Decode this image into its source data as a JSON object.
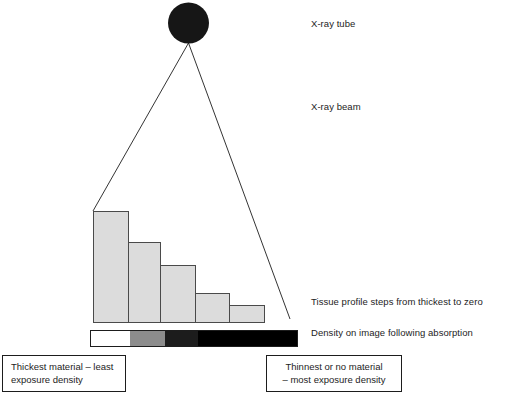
{
  "figure": {
    "background": "#ffffff"
  },
  "source": {
    "label": "x-ray-tube",
    "shape": "filled-circle",
    "color": "#161616",
    "cx": 188.5,
    "cy": 23,
    "r": 20.5
  },
  "beam": {
    "label": "x-ray-beam",
    "apex": {
      "x": 188.5,
      "y": 43
    },
    "left_end": {
      "x": 93,
      "y": 211
    },
    "right_end": {
      "x": 290,
      "y": 319
    },
    "stroke": "#1d1d1d",
    "stroke_width": 0.9
  },
  "labels": {
    "xray_tube": "X-ray tube",
    "xray_beam": "X-ray beam",
    "tissue_profile": "Tissue profile steps from thickest to zero",
    "density_on_image": "Density on image following absorption"
  },
  "captions": {
    "thickest": {
      "line1": "Thickest material – least",
      "line2": "exposure density"
    },
    "thinnest": {
      "line1": "Thinnest or no material",
      "line2": "– most exposure density"
    }
  },
  "chart_data": {
    "type": "bar",
    "title": "Tissue profile steps from thickest to zero",
    "xlabel": "",
    "ylabel": "Tissue thickness",
    "grid": false,
    "legend": false,
    "baseline_y": 322,
    "bar_fill": "#dcdcdc",
    "bar_stroke": "#4a4a4a",
    "categories": [
      "step-1",
      "step-2",
      "step-3",
      "step-4",
      "step-5"
    ],
    "values": [
      111,
      80,
      57,
      29,
      17
    ],
    "ylim": [
      0,
      120
    ],
    "bars": [
      {
        "name": "step-1",
        "x": 93,
        "width": 35,
        "top": 211,
        "height": 111
      },
      {
        "name": "step-2",
        "x": 128,
        "width": 32,
        "top": 242,
        "height": 80
      },
      {
        "name": "step-3",
        "x": 160,
        "width": 35,
        "top": 265,
        "height": 57
      },
      {
        "name": "step-4",
        "x": 195,
        "width": 34,
        "top": 293,
        "height": 29
      },
      {
        "name": "step-5",
        "x": 229,
        "width": 35,
        "top": 305,
        "height": 17
      }
    ]
  },
  "density_bar": {
    "name": "density-strip",
    "x": 90,
    "y": 330,
    "width": 208,
    "height": 17,
    "stroke": "#1d1d1d",
    "segments": [
      {
        "name": "density-segment-white",
        "label": "least exposure density",
        "color": "#ffffff",
        "width": 40
      },
      {
        "name": "density-segment-gray",
        "label": "low exposure density",
        "color": "#8c8c8c",
        "width": 35
      },
      {
        "name": "density-segment-dark",
        "label": "high exposure density",
        "color": "#1c1c1c",
        "width": 33
      },
      {
        "name": "density-segment-black",
        "label": "most exposure density",
        "color": "#000000",
        "width": 100
      }
    ]
  }
}
